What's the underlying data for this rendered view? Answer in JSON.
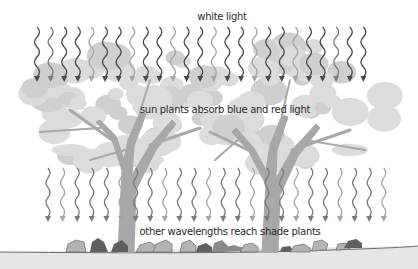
{
  "diagram": {
    "labels": {
      "top": "white light",
      "canopy": "sun plants absorb blue and red light",
      "ground": "other wavelengths reach shade plants"
    },
    "colors": {
      "background": "#ffffff",
      "canopy_light": "#dcdcdc",
      "canopy_mid": "#cfcfcf",
      "trunk": "#a8a8a8",
      "ground": "#e6e6e6",
      "ground_line": "#6b6b6b",
      "arrow_dark": "#4a4a4a",
      "arrow_mid": "#7a7a7a",
      "arrow_light": "#a5a5a5",
      "plant_dark": "#5f5f5f",
      "plant_mid": "#8a8a8a",
      "plant_light": "#b3b3b3",
      "text": "#2a2a2a"
    },
    "top_arrows": {
      "count": 25,
      "x_start": 37,
      "spacing": 13.6,
      "y_top": 27,
      "y_bottom": 82,
      "shades": [
        "dark",
        "mid",
        "dark",
        "dark",
        "light",
        "dark",
        "dark",
        "light",
        "dark",
        "dark",
        "light",
        "dark",
        "dark",
        "light",
        "dark",
        "dark",
        "light",
        "dark",
        "dark",
        "light",
        "dark",
        "dark",
        "mid",
        "dark",
        "dark"
      ]
    },
    "bottom_arrows": {
      "count": 24,
      "x_start": 48,
      "spacing": 14.6,
      "y_top": 168,
      "y_bottom": 222,
      "shades": [
        "mid",
        "light",
        "mid",
        "mid",
        "mid",
        "light",
        "mid",
        "mid",
        "light",
        "mid",
        "mid",
        "light",
        "mid",
        "mid",
        "light",
        "mid",
        "mid",
        "light",
        "mid",
        "mid",
        "light",
        "mid",
        "mid",
        "light"
      ]
    },
    "icons": {
      "wavy-arrow": "sinusoidal downward arrow representing light",
      "tree": "broad-canopy sun plant",
      "shade-plant": "low ground-level plant"
    }
  }
}
